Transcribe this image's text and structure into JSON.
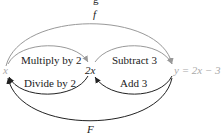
{
  "title_fragment": "g",
  "nodes": {
    "x": "x",
    "two_x": "2x",
    "y": "y = 2x − 3"
  },
  "arrows": {
    "f": "f",
    "F": "F",
    "multiply": "Multiply by 2",
    "divide": "Divide by 2",
    "subtract": "Subtract 3",
    "add": "Add 3"
  },
  "colors": {
    "forward_arrow": "#999999",
    "backward_arrow": "#222222",
    "y_node": "#aaaaaa"
  }
}
